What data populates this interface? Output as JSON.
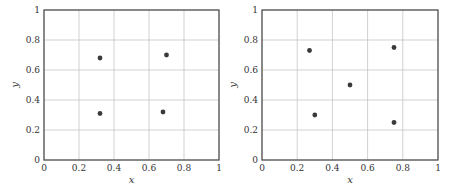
{
  "chart_data": [
    {
      "type": "scatter",
      "title": "",
      "xlabel": "x",
      "ylabel": "y",
      "xlim": [
        0,
        1
      ],
      "ylim": [
        0,
        1
      ],
      "grid": true,
      "xticks": [
        "0",
        "0.2",
        "0.4",
        "0.6",
        "0.8",
        "1"
      ],
      "yticks": [
        "0",
        "0.2",
        "0.4",
        "0.6",
        "0.8",
        "1"
      ],
      "marker_color": "#3a3a3a",
      "points": [
        {
          "x": 0.32,
          "y": 0.68
        },
        {
          "x": 0.7,
          "y": 0.7
        },
        {
          "x": 0.32,
          "y": 0.31
        },
        {
          "x": 0.68,
          "y": 0.32
        }
      ]
    },
    {
      "type": "scatter",
      "title": "",
      "xlabel": "x",
      "ylabel": "y",
      "xlim": [
        0,
        1
      ],
      "ylim": [
        0,
        1
      ],
      "grid": true,
      "xticks": [
        "0",
        "0.2",
        "0.4",
        "0.6",
        "0.8",
        "1"
      ],
      "yticks": [
        "0",
        "0.2",
        "0.4",
        "0.6",
        "0.8",
        "1"
      ],
      "marker_color": "#3a3a3a",
      "points": [
        {
          "x": 0.27,
          "y": 0.73
        },
        {
          "x": 0.75,
          "y": 0.75
        },
        {
          "x": 0.5,
          "y": 0.5
        },
        {
          "x": 0.3,
          "y": 0.3
        },
        {
          "x": 0.75,
          "y": 0.25
        }
      ]
    }
  ]
}
